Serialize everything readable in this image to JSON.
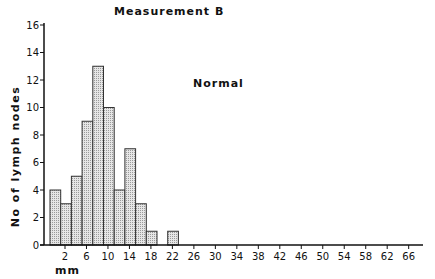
{
  "chart_data": {
    "type": "bar",
    "title": "Measurement B",
    "annotation": "Normal",
    "xlabel": "mm",
    "ylabel": "No of lymph nodes",
    "ylim": [
      0,
      16
    ],
    "y_ticks": [
      0,
      2,
      4,
      6,
      8,
      10,
      12,
      14,
      16
    ],
    "x_ticks": [
      2,
      6,
      10,
      14,
      18,
      22,
      26,
      30,
      34,
      38,
      42,
      46,
      50,
      54,
      58,
      62,
      66
    ],
    "categories": [
      "0-2",
      "2-4",
      "4-6",
      "6-8",
      "8-10",
      "10-12",
      "12-14",
      "14-16",
      "16-18",
      "18-20",
      "20-22",
      "22-24"
    ],
    "values": [
      4,
      3,
      5,
      9,
      13,
      10,
      4,
      7,
      3,
      1,
      0,
      1
    ],
    "grid": false,
    "legend": null,
    "bar_fill": "#d9d9d9",
    "bar_edge": "#333333"
  }
}
